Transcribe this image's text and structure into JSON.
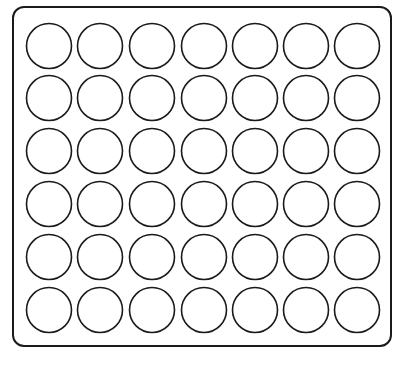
{
  "board": {
    "rows": 6,
    "columns": 7,
    "cell_state": "empty",
    "stroke_color": "#1a1a1a",
    "fill_color": "#ffffff",
    "column_centers_x": [
      49,
      100,
      152,
      204,
      255,
      306,
      357
    ],
    "row_centers_y": [
      46,
      98,
      151,
      204,
      257,
      310
    ],
    "circle_radius": 22.5
  }
}
